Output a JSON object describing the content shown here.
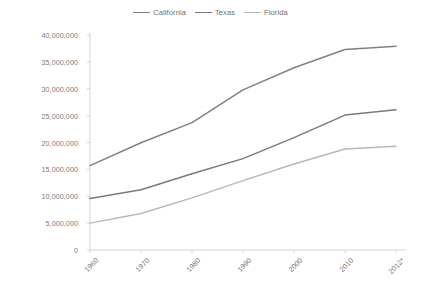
{
  "chart_data": {
    "type": "line",
    "title": "",
    "subtitle": "",
    "xlabel": "",
    "ylabel": "",
    "x": [
      "1960",
      "1970",
      "1980",
      "1990",
      "2000",
      "2010",
      "2012*"
    ],
    "categories": [
      "1960",
      "1970",
      "1980",
      "1990",
      "2000",
      "2010",
      "2012*"
    ],
    "series": [
      {
        "name": "California",
        "color": "#808080",
        "values": [
          15700000,
          19950000,
          23700000,
          29800000,
          33900000,
          37300000,
          37900000
        ]
      },
      {
        "name": "Texas",
        "color": "#7a7a7a",
        "values": [
          9600000,
          11200000,
          14200000,
          17000000,
          20900000,
          25100000,
          26100000
        ]
      },
      {
        "name": "Florida",
        "color": "#b8b8b8",
        "values": [
          5000000,
          6800000,
          9700000,
          12900000,
          16000000,
          18800000,
          19300000
        ]
      }
    ],
    "ylim": [
      0,
      40000000
    ],
    "y_ticks": [
      0,
      5000000,
      10000000,
      15000000,
      20000000,
      25000000,
      30000000,
      35000000,
      40000000
    ],
    "y_tick_labels": [
      "0",
      "5,000,000",
      "10,000,000",
      "15,000,000",
      "20,000,000",
      "25,000,000",
      "30,000,000",
      "35,000,000",
      "40,000,000"
    ],
    "grid": false,
    "legend_position": "top-center",
    "legend_entries": [
      "California",
      "Texas",
      "Florida"
    ]
  },
  "legend": {
    "items": [
      {
        "label": "California",
        "color": "#808080"
      },
      {
        "label": "Texas",
        "color": "#7a7a7a"
      },
      {
        "label": "Florida",
        "color": "#b8b8b8"
      }
    ]
  },
  "axes": {
    "y_labels": [
      "40,000,000",
      "35,000,000",
      "30,000,000",
      "25,000,000",
      "20,000,000",
      "15,000,000",
      "10,000,000",
      "5,000,000",
      "0"
    ],
    "x_labels": [
      "1960",
      "1970",
      "1980",
      "1990",
      "2000",
      "2010",
      "2012*"
    ]
  }
}
